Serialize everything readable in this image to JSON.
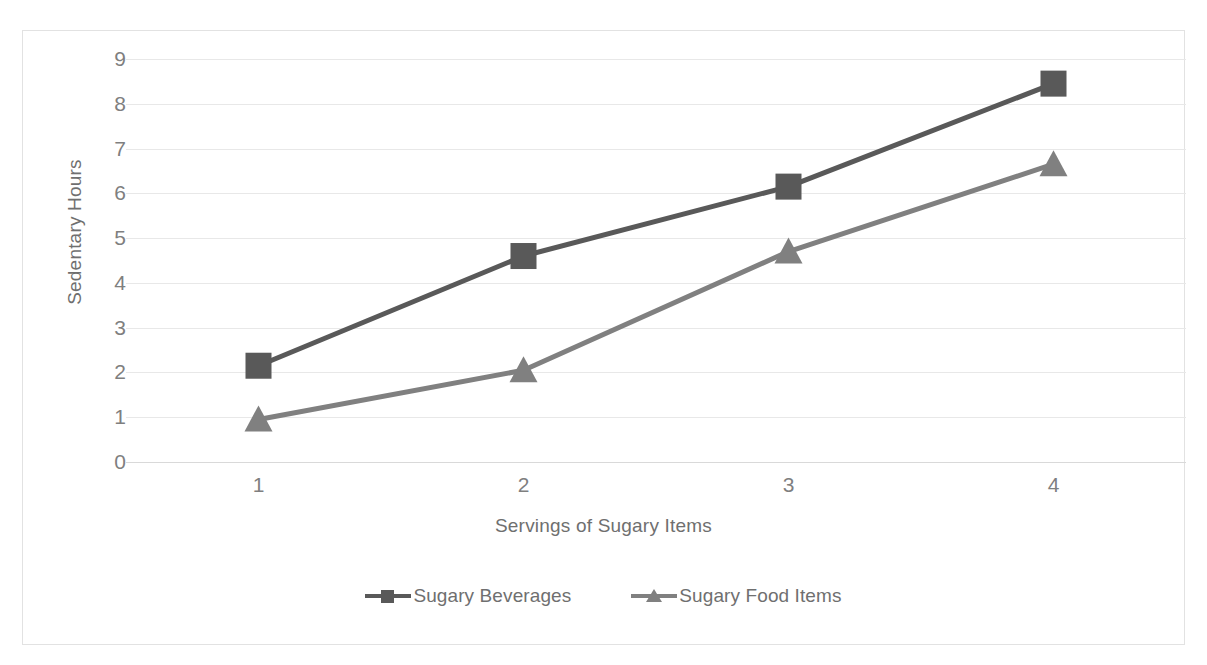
{
  "chart_data": {
    "type": "line",
    "title": "",
    "xlabel": "Servings of Sugary Items",
    "ylabel": "Sedentary Hours",
    "categories": [
      "1",
      "2",
      "3",
      "4"
    ],
    "x": [
      1,
      2,
      3,
      4
    ],
    "ylim": [
      0,
      9
    ],
    "yticks": [
      "9",
      "8",
      "7",
      "6",
      "5",
      "4",
      "3",
      "2",
      "1",
      "0"
    ],
    "ytick_values": [
      9,
      8,
      7,
      6,
      5,
      4,
      3,
      2,
      1,
      0
    ],
    "grid": true,
    "legend_position": "bottom-center",
    "series": [
      {
        "name": "Sugary Beverages",
        "values": [
          2.15,
          4.6,
          6.15,
          8.45
        ],
        "color": "#595959",
        "marker": "square"
      },
      {
        "name": "Sugary Food Items",
        "values": [
          0.95,
          2.05,
          4.7,
          6.65
        ],
        "color": "#808080",
        "marker": "triangle"
      }
    ]
  },
  "legend": {
    "items": [
      {
        "label": "Sugary Beverages",
        "color": "#595959",
        "marker": "square"
      },
      {
        "label": "Sugary Food Items",
        "color": "#808080",
        "marker": "triangle"
      }
    ]
  },
  "axes": {
    "y_title": "Sedentary Hours",
    "x_title": "Servings of Sugary Items",
    "y_labels": [
      "9",
      "8",
      "7",
      "6",
      "5",
      "4",
      "3",
      "2",
      "1",
      "0"
    ],
    "x_labels": [
      "1",
      "2",
      "3",
      "4"
    ]
  },
  "colors": {
    "background": "#ffffff",
    "frame_border": "#e2e2e2",
    "gridline": "#e8e8e8",
    "tick_text": "#7f7f7f",
    "axis_title_text": "#6f6f6f",
    "series1": "#595959",
    "series2": "#808080"
  }
}
